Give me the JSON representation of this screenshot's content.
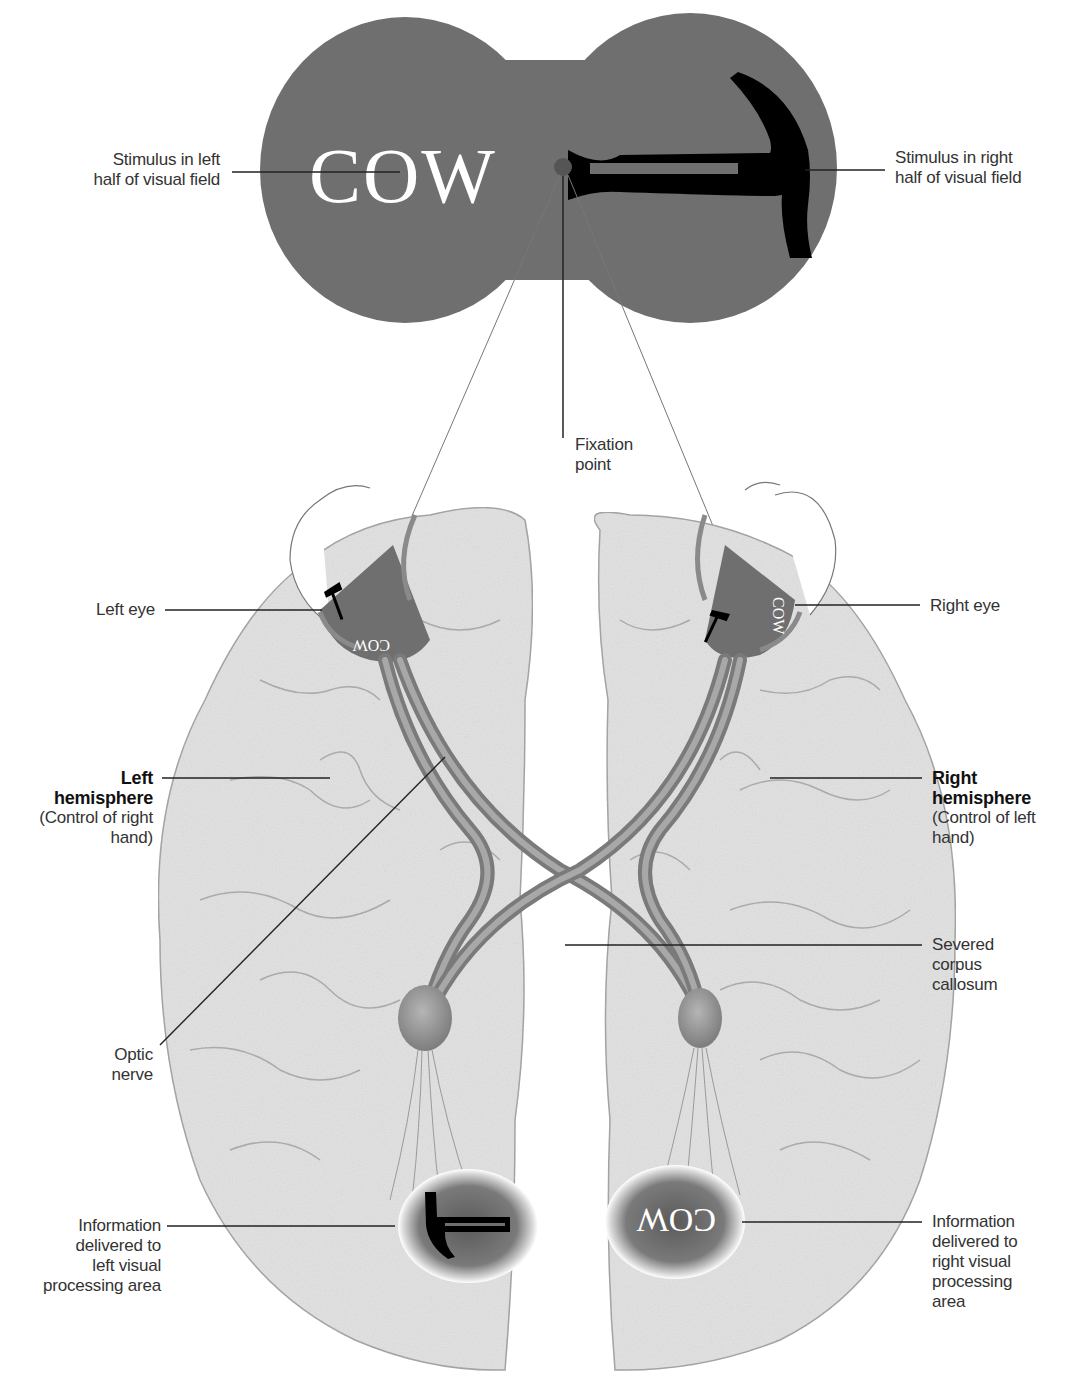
{
  "diagram": {
    "type": "split-brain visual field diagram",
    "colors": {
      "visual_field": "#6f6f6f",
      "fixation_point": "#555555",
      "stimulus_text": "#ffffff",
      "hammer": "#000000",
      "brain": "#e2e2e2",
      "brain_outline": "#9a9a9a",
      "optic_nerve": "#8c8c8c",
      "eye_patch": "#6f6f6f",
      "label_text": "#333333",
      "leader_line": "#222222"
    },
    "stimuli": {
      "left_word": "COW",
      "right_object": "hammer",
      "left_eye_word": "COW",
      "right_eye_word": "COW",
      "right_processing_word": "COW",
      "left_processing_object": "hammer"
    },
    "labels": {
      "stimulus_left": [
        "Stimulus in left",
        "half of visual field"
      ],
      "stimulus_right": [
        "Stimulus in right",
        "half of visual field"
      ],
      "fixation": [
        "Fixation",
        "point"
      ],
      "left_eye": "Left eye",
      "right_eye": "Right eye",
      "left_hemisphere": {
        "title": [
          "Left",
          "hemisphere"
        ],
        "desc": [
          "(Control of right",
          "hand)"
        ]
      },
      "right_hemisphere": {
        "title": [
          "Right",
          "hemisphere"
        ],
        "desc": [
          "(Control of left",
          "hand)"
        ]
      },
      "corpus_callosum": [
        "Severed",
        "corpus",
        "callosum"
      ],
      "optic_nerve": [
        "Optic",
        "nerve"
      ],
      "info_left": [
        "Information",
        "delivered to",
        "left visual",
        "processing area"
      ],
      "info_right": [
        "Information",
        "delivered to",
        "right visual",
        "processing",
        "area"
      ]
    }
  }
}
